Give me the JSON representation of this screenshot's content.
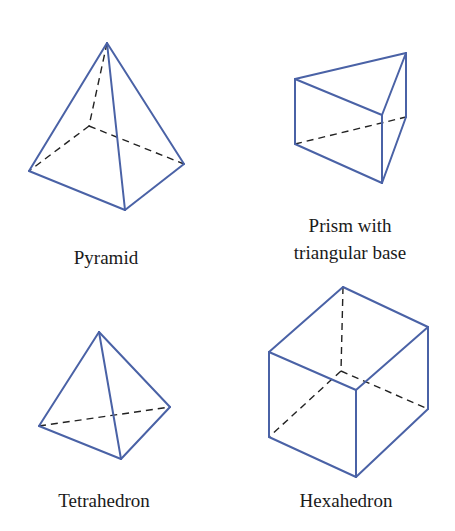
{
  "figure": {
    "stroke_color": "#4a62a6",
    "hidden_line_color": "#222222",
    "shapes": [
      {
        "id": "pyramid",
        "label": "Pyramid",
        "vertices": {
          "apex": [
            107,
            43
          ],
          "left": [
            29,
            171
          ],
          "front": [
            125,
            210
          ],
          "right": [
            184,
            164
          ],
          "back_hidden": [
            89,
            126
          ]
        }
      },
      {
        "id": "prism",
        "label_line1": "Prism with",
        "label_line2": "triangular base",
        "vertices": {
          "top_left": [
            295,
            79
          ],
          "top_back": [
            406,
            53
          ],
          "top_front": [
            382,
            115
          ],
          "bottom_left": [
            295,
            144
          ],
          "bottom_back_hidden": [
            406,
            117
          ],
          "bottom_front": [
            382,
            183
          ]
        }
      },
      {
        "id": "tetrahedron",
        "label": "Tetrahedron",
        "vertices": {
          "apex": [
            99,
            332
          ],
          "left": [
            39,
            426
          ],
          "right": [
            170,
            407
          ],
          "front": [
            121,
            459
          ]
        }
      },
      {
        "id": "hexahedron",
        "label": "Hexahedron",
        "vertices": {
          "top_back": [
            343,
            287
          ],
          "top_right": [
            428,
            327
          ],
          "top_left": [
            269,
            352
          ],
          "top_front": [
            356,
            390
          ],
          "bottom_back_hidden": [
            341,
            371
          ],
          "bottom_right": [
            428,
            409
          ],
          "bottom_left": [
            269,
            437
          ],
          "bottom_front": [
            356,
            477
          ]
        }
      }
    ]
  }
}
